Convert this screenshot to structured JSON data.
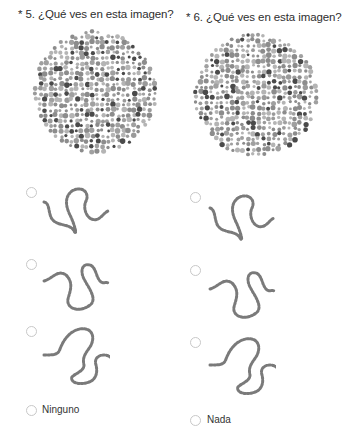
{
  "questions": [
    {
      "title": "* 5. ¿Qué ves en esta imagen?",
      "plate_icon": "ishihara-color-plate",
      "options": [
        {
          "type": "image",
          "icon": "squiggle-path-option-1",
          "selected": false
        },
        {
          "type": "image",
          "icon": "squiggle-path-option-2",
          "selected": false
        },
        {
          "type": "image",
          "icon": "squiggle-path-option-3",
          "selected": false
        },
        {
          "type": "text",
          "label": "Ninguno",
          "selected": false
        }
      ]
    },
    {
      "title": "* 6. ¿Qué ves en esta imagen?",
      "plate_icon": "ishihara-color-plate",
      "options": [
        {
          "type": "image",
          "icon": "squiggle-path-option-1",
          "selected": false
        },
        {
          "type": "image",
          "icon": "squiggle-path-option-2",
          "selected": false
        },
        {
          "type": "image",
          "icon": "squiggle-path-option-3",
          "selected": false
        },
        {
          "type": "text",
          "label": "Nada",
          "selected": false
        }
      ]
    }
  ],
  "colors": {
    "text": "#2e2e2e",
    "radio_border": "#c8c8c8",
    "dot_light": "#b4b4b4",
    "dot_mid": "#8c8c8c",
    "dot_dark": "#4a4a4a"
  }
}
